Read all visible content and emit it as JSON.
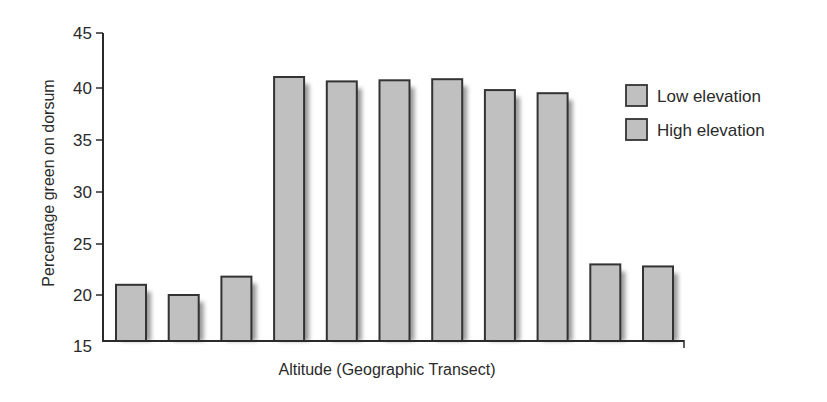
{
  "chart_data": {
    "type": "bar",
    "title": "",
    "xlabel": "Altitude (Geographic Transect)",
    "ylabel": "Percentage green on dorsum",
    "ylim": [
      15,
      45
    ],
    "yticks": [
      15,
      20,
      25,
      30,
      35,
      40,
      45
    ],
    "grid": false,
    "legend_position": "upper right",
    "categories": [
      "1",
      "2",
      "3",
      "4",
      "5",
      "6",
      "7",
      "8",
      "9",
      "10",
      "11"
    ],
    "values": [
      21,
      20,
      21.8,
      41,
      40.6,
      40.7,
      40.8,
      39.8,
      39.5,
      23,
      22.8
    ],
    "legend": [
      {
        "label": "Low elevation",
        "color": "#c0c0c0"
      },
      {
        "label": "High elevation",
        "color": "#c0c0c0"
      }
    ],
    "bar_color": "#c0c0c0",
    "bar_edge_color": "#333333",
    "shadow_color": "#9a9a9a"
  }
}
